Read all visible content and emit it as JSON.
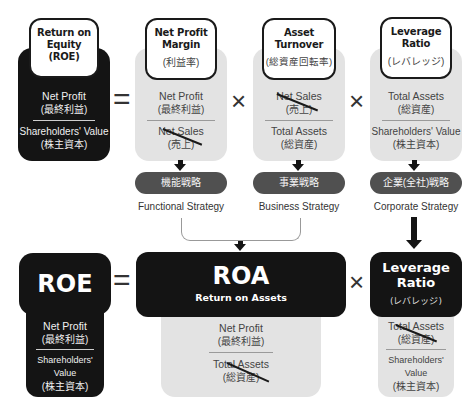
{
  "top_row": {
    "roe": {
      "title_lines": [
        "Return on",
        "Equity",
        "(ROE)"
      ],
      "numerator": "Net Profit",
      "numerator_jp": "(最終利益)",
      "denominator": "Shareholders' Value",
      "denominator_jp": "(株主資本)"
    },
    "equals": "=",
    "net_profit_margin": {
      "title_lines": [
        "Net Profit",
        "Margin"
      ],
      "subtitle_jp": "(利益率)",
      "numerator": "Net Profit",
      "numerator_jp": "(最終利益)",
      "denominator": "Net Sales",
      "denominator_jp": "(売上)",
      "denominator_struck": true
    },
    "times1": "×",
    "asset_turnover": {
      "title_lines": [
        "Asset",
        "Turnover"
      ],
      "subtitle_jp": "(総資産回転率)",
      "numerator": "Net Sales",
      "numerator_jp": "(売上)",
      "numerator_struck": true,
      "denominator": "Total Assets",
      "denominator_jp": "(総資産)"
    },
    "times2": "×",
    "leverage_ratio": {
      "title_lines": [
        "Leverage",
        "Ratio"
      ],
      "subtitle_jp": "(レバレッジ)",
      "numerator": "Total Assets",
      "numerator_jp": "(総資産)",
      "denominator": "Shareholders' Value",
      "denominator_jp": "(株主資本)"
    }
  },
  "strategies": [
    {
      "jp": "機能戦略",
      "en": "Functional Strategy"
    },
    {
      "jp": "事業戦略",
      "en": "Business Strategy"
    },
    {
      "jp": "企業(全社)戦略",
      "en": "Corporate Strategy"
    }
  ],
  "bottom_row": {
    "roe": {
      "title": "ROE",
      "numerator": "Net Profit",
      "numerator_jp": "(最終利益)",
      "denominator": "Shareholders' Value",
      "denominator_jp": "(株主資本)"
    },
    "equals": "=",
    "roa": {
      "title": "ROA",
      "subtitle": "Return on Assets",
      "numerator": "Net Profit",
      "numerator_jp": "(最終利益)",
      "denominator": "Total Assets",
      "denominator_jp": "(総資産)",
      "denominator_struck": true
    },
    "times": "×",
    "leverage_ratio": {
      "title_lines": [
        "Leverage",
        "Ratio"
      ],
      "subtitle_jp": "(レバレッジ)",
      "numerator": "Total Assets",
      "numerator_jp": "(総資産)",
      "numerator_struck": true,
      "denominator": "Shareholders' Value",
      "denominator_jp": "(株主資本)"
    }
  },
  "colors": {
    "dark_panel": "#141414",
    "light_panel": "#e3e3e3",
    "pill": "#505050"
  }
}
